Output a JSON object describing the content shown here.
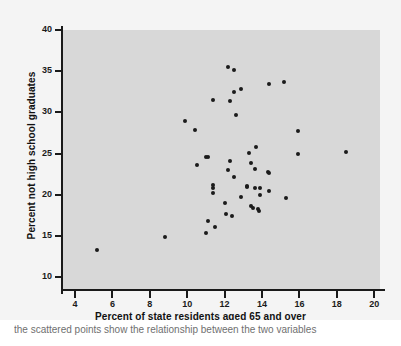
{
  "chart_data": {
    "type": "scatter",
    "title": "",
    "xlabel": "Percent of state residents aged 65 and over",
    "ylabel": "Percent not high school graduates",
    "xlim": [
      3.2,
      20.7
    ],
    "ylim": [
      8.5,
      41.5
    ],
    "xticks": [
      4,
      6,
      8,
      10,
      12,
      14,
      16,
      18,
      20
    ],
    "yticks": [
      10,
      15,
      20,
      25,
      30,
      35,
      40
    ],
    "grid": false,
    "legend": null,
    "marker": "filled-circle",
    "marker_color": "#1b1b1b",
    "plot_background": "#d8d8d8",
    "figure_background": "#f4f4f4",
    "points": [
      {
        "x": 5.2,
        "y": 13.3
      },
      {
        "x": 8.8,
        "y": 14.8
      },
      {
        "x": 9.9,
        "y": 29.0
      },
      {
        "x": 10.4,
        "y": 27.8
      },
      {
        "x": 10.5,
        "y": 23.6
      },
      {
        "x": 11.0,
        "y": 24.6
      },
      {
        "x": 11.1,
        "y": 24.6
      },
      {
        "x": 11.0,
        "y": 15.4
      },
      {
        "x": 11.1,
        "y": 16.8
      },
      {
        "x": 11.4,
        "y": 21.2
      },
      {
        "x": 11.4,
        "y": 20.8
      },
      {
        "x": 11.4,
        "y": 20.2
      },
      {
        "x": 11.4,
        "y": 31.5
      },
      {
        "x": 11.5,
        "y": 16.1
      },
      {
        "x": 12.0,
        "y": 19.0
      },
      {
        "x": 12.1,
        "y": 17.6
      },
      {
        "x": 12.2,
        "y": 23.0
      },
      {
        "x": 12.2,
        "y": 35.5
      },
      {
        "x": 12.3,
        "y": 31.4
      },
      {
        "x": 12.3,
        "y": 24.1
      },
      {
        "x": 12.4,
        "y": 17.4
      },
      {
        "x": 12.5,
        "y": 35.2
      },
      {
        "x": 12.5,
        "y": 32.5
      },
      {
        "x": 12.5,
        "y": 22.2
      },
      {
        "x": 12.6,
        "y": 29.7
      },
      {
        "x": 12.9,
        "y": 32.8
      },
      {
        "x": 12.9,
        "y": 19.7
      },
      {
        "x": 13.2,
        "y": 21.1
      },
      {
        "x": 13.2,
        "y": 20.9
      },
      {
        "x": 13.3,
        "y": 25.1
      },
      {
        "x": 13.4,
        "y": 23.9
      },
      {
        "x": 13.4,
        "y": 18.6
      },
      {
        "x": 13.5,
        "y": 18.4
      },
      {
        "x": 13.6,
        "y": 23.1
      },
      {
        "x": 13.6,
        "y": 20.8
      },
      {
        "x": 13.7,
        "y": 25.8
      },
      {
        "x": 13.8,
        "y": 18.2
      },
      {
        "x": 13.85,
        "y": 18.0
      },
      {
        "x": 13.9,
        "y": 20.8
      },
      {
        "x": 13.9,
        "y": 20.0
      },
      {
        "x": 14.3,
        "y": 22.8
      },
      {
        "x": 14.35,
        "y": 22.6
      },
      {
        "x": 14.4,
        "y": 20.5
      },
      {
        "x": 14.4,
        "y": 33.4
      },
      {
        "x": 15.2,
        "y": 33.7
      },
      {
        "x": 15.3,
        "y": 19.6
      },
      {
        "x": 15.9,
        "y": 27.7
      },
      {
        "x": 15.95,
        "y": 24.9
      },
      {
        "x": 18.5,
        "y": 25.2
      }
    ]
  },
  "caption": {
    "text": "the scattered points show the relationship between the two variables"
  }
}
